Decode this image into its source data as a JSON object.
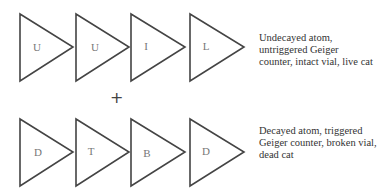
{
  "diagram": {
    "rows": [
      {
        "labels": [
          "U",
          "U",
          "I",
          "L"
        ],
        "description": "Undecayed atom, untriggered Geiger counter, intact vial, live cat"
      },
      {
        "labels": [
          "D",
          "T",
          "B",
          "D"
        ],
        "description": "Decayed atom, triggered Geiger counter, broken vial, dead cat"
      }
    ],
    "operator": "+"
  }
}
